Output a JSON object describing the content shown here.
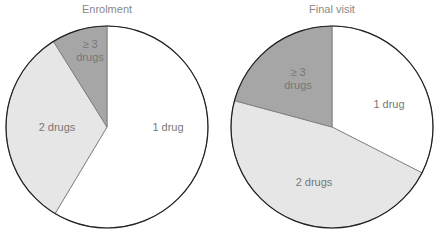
{
  "chart_data": [
    {
      "type": "pie",
      "title": "Enrolment",
      "categories": [
        "1 drug",
        "2 drugs",
        "≥ 3 drugs"
      ],
      "values": [
        58.6,
        32.5,
        8.9
      ],
      "colors": [
        "#ffffff",
        "#e6e6e6",
        "#a6a6a6"
      ],
      "center": [
        107,
        127
      ],
      "radius": 101
    },
    {
      "type": "pie",
      "title": "Final visit",
      "categories": [
        "1 drug",
        "2 drugs",
        "≥ 3 drugs"
      ],
      "values": [
        32.5,
        46.7,
        20.8
      ],
      "colors": [
        "#ffffff",
        "#e6e6e6",
        "#a6a6a6"
      ],
      "center": [
        332,
        127
      ],
      "radius": 101
    }
  ],
  "labels": {
    "left": {
      "one": "1 drug",
      "two": "2 drugs",
      "three_a": "≥ 3",
      "three_b": "drugs"
    },
    "right": {
      "one": "1 drug",
      "two": "2 drugs",
      "three_a": "≥ 3",
      "three_b": "drugs"
    }
  }
}
